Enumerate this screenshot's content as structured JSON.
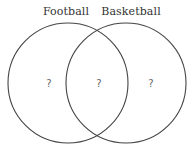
{
  "diagram": {
    "type": "venn",
    "sets": [
      {
        "label": "Football",
        "center": [
          68,
          83
        ],
        "radius": 60
      },
      {
        "label": "Basketball",
        "center": [
          126,
          83
        ],
        "radius": 60
      }
    ],
    "regions": {
      "football_only": "?",
      "both": "?",
      "basketball_only": "?"
    },
    "colors": {
      "stroke": "#444444",
      "label": "#333333",
      "region_text": "#666666",
      "background": "#ffffff"
    }
  }
}
